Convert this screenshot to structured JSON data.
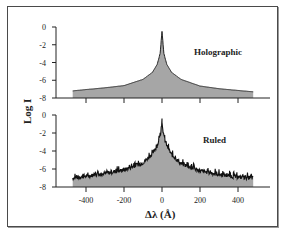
{
  "chart_data": [
    {
      "type": "area",
      "panel": "top",
      "series_label": "Holographic",
      "xlabel": "Δλ (Å)",
      "ylabel": "Log I",
      "xlim": [
        -500,
        500
      ],
      "ylim": [
        -8,
        0
      ],
      "x_ticks": [
        -400,
        -200,
        0,
        200,
        400
      ],
      "y_ticks": [
        0,
        -2,
        -4,
        -6,
        -8
      ],
      "y_tick_labels": [
        "0",
        "-2",
        "-4",
        "-6",
        "-8"
      ],
      "x": [
        -470,
        -400,
        -300,
        -200,
        -100,
        -50,
        -25,
        -10,
        0,
        10,
        25,
        50,
        100,
        200,
        300,
        400,
        480
      ],
      "values": [
        -7.2,
        -7.05,
        -6.85,
        -6.6,
        -5.9,
        -5.1,
        -4.2,
        -3.0,
        -0.5,
        -3.0,
        -4.2,
        -5.1,
        -5.9,
        -6.65,
        -6.95,
        -7.15,
        -7.3
      ],
      "fill_color": "#a6a6a6",
      "line_color": "#222222",
      "grid": false
    },
    {
      "type": "area",
      "panel": "bottom",
      "series_label": "Ruled",
      "xlabel": "Δλ (Å)",
      "ylabel": "Log I",
      "xlim": [
        -500,
        500
      ],
      "ylim": [
        -8,
        0
      ],
      "x_ticks": [
        -400,
        -200,
        0,
        200,
        400
      ],
      "x_tick_labels": [
        "-400",
        "-200",
        "0",
        "200",
        "400"
      ],
      "y_ticks": [
        0,
        -2,
        -4,
        -6,
        -8
      ],
      "y_tick_labels": [
        "0",
        "-2",
        "-4",
        "-6",
        "-8"
      ],
      "x": [
        -470,
        -400,
        -300,
        -200,
        -100,
        -50,
        -25,
        -10,
        0,
        10,
        25,
        50,
        100,
        200,
        300,
        400,
        480
      ],
      "values": [
        -7.0,
        -6.8,
        -6.5,
        -6.1,
        -5.3,
        -4.3,
        -3.4,
        -2.4,
        -0.8,
        -2.4,
        -3.4,
        -4.4,
        -5.4,
        -6.2,
        -6.6,
        -6.9,
        -7.0
      ],
      "noise": "high-frequency jitter along curve (scattered light)",
      "fill_color": "#a6a6a6",
      "line_color": "#111111",
      "grid": false
    }
  ],
  "labels": {
    "ylabel": "Log I",
    "xlabel": "Δλ (Å)",
    "top_series": "Holographic",
    "bottom_series": "Ruled",
    "x_tick_labels": [
      "-400",
      "-200",
      "0",
      "200",
      "400"
    ],
    "y_tick_labels": [
      "0",
      "-2",
      "-4",
      "-6",
      "-8"
    ]
  }
}
